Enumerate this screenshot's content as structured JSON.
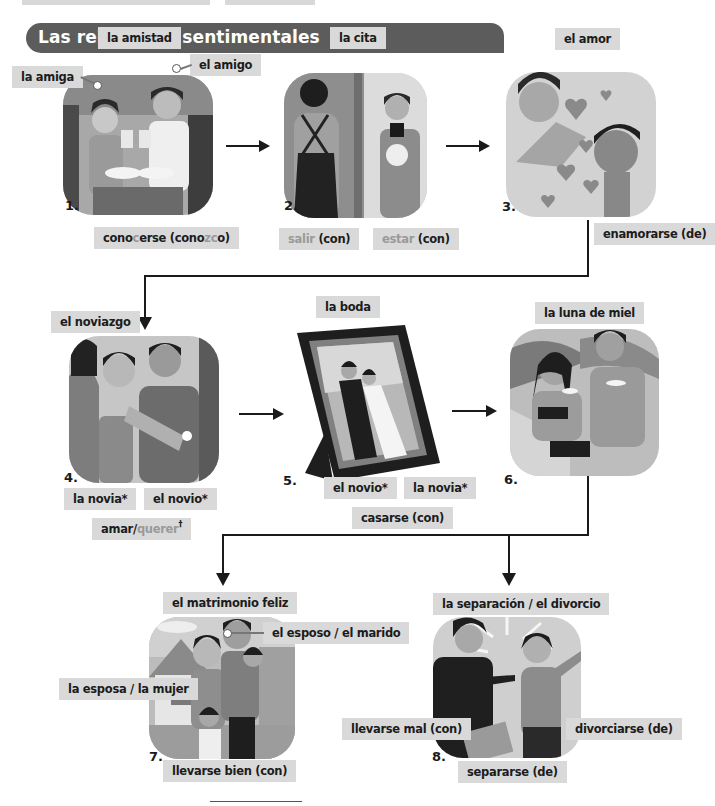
{
  "header": {
    "title": "Las relaciones sentimentales"
  },
  "colors": {
    "header_bg": "#5c5c5c",
    "label_bg": "#d9d9d9",
    "highlight_text": "#9a9a9a",
    "arrow": "#1a1a1a"
  },
  "panels": [
    {
      "number": "1.",
      "scene": "friends-toasting",
      "labels": {
        "top": "la amistad",
        "left": "la amiga",
        "right": "el amigo"
      },
      "verbs": [
        {
          "parts": [
            {
              "t": "cono",
              "hl": false
            },
            {
              "t": "c",
              "hl": true
            },
            {
              "t": "erse (cono",
              "hl": false
            },
            {
              "t": "zc",
              "hl": true
            },
            {
              "t": "o)",
              "hl": false
            }
          ]
        }
      ]
    },
    {
      "number": "2.",
      "scene": "date-at-door",
      "labels": {
        "top": "la cita"
      },
      "verbs": [
        {
          "parts": [
            {
              "t": "salir",
              "hl": true
            },
            {
              "t": " (con)",
              "hl": false
            }
          ]
        },
        {
          "parts": [
            {
              "t": "estar",
              "hl": true
            },
            {
              "t": " (con)",
              "hl": false
            }
          ]
        }
      ]
    },
    {
      "number": "3.",
      "scene": "couple-in-love-hearts",
      "labels": {
        "top": "el amor"
      },
      "verbs": [
        {
          "parts": [
            {
              "t": "enamorarse (de)",
              "hl": false
            }
          ]
        }
      ]
    },
    {
      "number": "4.",
      "scene": "engagement-ring",
      "labels": {
        "top": "el noviazgo",
        "left": "la novia*",
        "right": "el novio*"
      },
      "verbs": [
        {
          "parts": [
            {
              "t": "amar/",
              "hl": false
            },
            {
              "t": "querer",
              "hl": true
            },
            {
              "t": "†",
              "hl": false
            }
          ]
        }
      ]
    },
    {
      "number": "5.",
      "scene": "wedding-photo-frame",
      "labels": {
        "top": "la boda",
        "left": "el novio*",
        "right": "la novia*"
      },
      "verbs": [
        {
          "parts": [
            {
              "t": "casarse (con)",
              "hl": false
            }
          ]
        }
      ]
    },
    {
      "number": "6.",
      "scene": "honeymoon-beach",
      "labels": {
        "top": "la luna de miel"
      },
      "verbs": []
    },
    {
      "number": "7.",
      "scene": "happy-family-house",
      "labels": {
        "top": "el matrimonio feliz",
        "right": "el esposo / el marido",
        "left": "la esposa / la mujer"
      },
      "verbs": [
        {
          "parts": [
            {
              "t": "llevarse bien (con)",
              "hl": false
            }
          ]
        }
      ]
    },
    {
      "number": "8.",
      "scene": "couple-arguing",
      "labels": {
        "top": "la separación / el divorcio"
      },
      "verbs": [
        {
          "parts": [
            {
              "t": "llevarse mal (con)",
              "hl": false
            }
          ]
        },
        {
          "parts": [
            {
              "t": "divorciarse (de)",
              "hl": false
            }
          ]
        },
        {
          "parts": [
            {
              "t": "separarse (de)",
              "hl": false
            }
          ]
        }
      ]
    }
  ]
}
